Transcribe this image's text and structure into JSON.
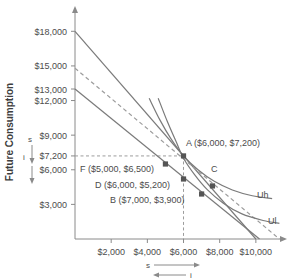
{
  "chart_data": {
    "type": "line",
    "title": "",
    "xlabel": "",
    "ylabel": "Future Consumption",
    "xlim": [
      0,
      11500
    ],
    "ylim": [
      0,
      19500
    ],
    "grid": false,
    "legend_position": "inline-right",
    "x_ticks": [
      {
        "value": 2000,
        "label": "$2,000"
      },
      {
        "value": 4000,
        "label": "$4,000"
      },
      {
        "value": 6000,
        "label": "$6,000"
      },
      {
        "value": 8000,
        "label": "$8,000"
      },
      {
        "value": 10000,
        "label": "$10,000"
      }
    ],
    "y_ticks": [
      {
        "value": 18000,
        "label": "$18,000"
      },
      {
        "value": 15000,
        "label": "$15,000"
      },
      {
        "value": 13000,
        "label": "$13,000"
      },
      {
        "value": 12000,
        "label": "$12,000"
      },
      {
        "value": 9000,
        "label": "$9,000"
      },
      {
        "value": 7200,
        "label": "$7,200"
      },
      {
        "value": 6000,
        "label": "$6,000"
      },
      {
        "value": 3000,
        "label": "$3,000"
      }
    ],
    "series": [
      {
        "name": "budget-line-high",
        "style": "solid",
        "points": [
          [
            0,
            18000
          ],
          [
            10000,
            0
          ]
        ]
      },
      {
        "name": "budget-line-mid",
        "style": "dashed",
        "points": [
          [
            0,
            14800
          ],
          [
            11300,
            0
          ]
        ]
      },
      {
        "name": "budget-line-low",
        "style": "solid",
        "points": [
          [
            0,
            13000
          ],
          [
            10200,
            0
          ]
        ]
      },
      {
        "name": "Uh",
        "style": "solid",
        "label": "Uh",
        "points": [
          [
            4100,
            12200
          ],
          [
            4700,
            10300
          ],
          [
            5300,
            8700
          ],
          [
            6000,
            7200
          ],
          [
            6800,
            6000
          ],
          [
            7700,
            5000
          ],
          [
            8700,
            4250
          ],
          [
            9800,
            3750
          ],
          [
            10900,
            3500
          ]
        ]
      },
      {
        "name": "Ul",
        "style": "solid",
        "label": "Ul",
        "points": [
          [
            4600,
            12200
          ],
          [
            5100,
            10200
          ],
          [
            5600,
            8400
          ],
          [
            6000,
            7000
          ],
          [
            6600,
            5600
          ],
          [
            7300,
            4300
          ],
          [
            8200,
            3100
          ],
          [
            9200,
            2200
          ],
          [
            10400,
            1600
          ],
          [
            11300,
            1350
          ]
        ]
      }
    ],
    "points": [
      {
        "id": "A",
        "x": 6000,
        "y": 7200,
        "label": "A ($6,000, $7,200)",
        "marker": "square"
      },
      {
        "id": "F",
        "x": 5000,
        "y": 6500,
        "label": "F ($5,000, $6,500)",
        "marker": "square"
      },
      {
        "id": "D",
        "x": 6000,
        "y": 5200,
        "label": "D ($6,000, $5,200)",
        "marker": "square"
      },
      {
        "id": "B",
        "x": 7000,
        "y": 3900,
        "label": "B ($7,000, $3,900)",
        "marker": "square"
      },
      {
        "id": "C",
        "x": 7600,
        "y": 4600,
        "label": "C",
        "marker": "square"
      }
    ],
    "guide_lines": [
      {
        "name": "guide-horizontal-7200",
        "orientation": "horizontal",
        "value": 7200,
        "style": "dashed"
      },
      {
        "name": "guide-vertical-6000",
        "orientation": "vertical",
        "value": 6000,
        "style": "dashed"
      }
    ],
    "annotations": {
      "y_axis_save_label": "s",
      "y_axis_invest_label": "i",
      "x_axis_save_label": "s",
      "x_axis_invest_label": "i"
    },
    "colors": {
      "line": "#7a7a7a",
      "dashed_line": "#9c9c9c",
      "marker": "#555555",
      "text": "#4c4c4c",
      "axis": "#8a8a8a",
      "background": "#ffffff"
    }
  }
}
